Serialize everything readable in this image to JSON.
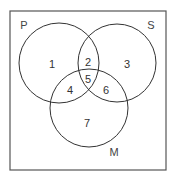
{
  "diagram": {
    "type": "venn",
    "border": {
      "x": 10,
      "y": 11,
      "width": 156,
      "height": 159
    },
    "sets": [
      {
        "name": "P",
        "cx": 59,
        "cy": 63,
        "r": 40,
        "label_x": 24,
        "label_y": 29
      },
      {
        "name": "S",
        "cx": 117,
        "cy": 63,
        "r": 39,
        "label_x": 151,
        "label_y": 29
      },
      {
        "name": "M",
        "cx": 89,
        "cy": 108,
        "r": 39,
        "label_x": 114,
        "label_y": 156
      }
    ],
    "regions": [
      {
        "label": "1",
        "x": 52,
        "y": 64
      },
      {
        "label": "2",
        "x": 88,
        "y": 62
      },
      {
        "label": "3",
        "x": 127,
        "y": 64
      },
      {
        "label": "4",
        "x": 70,
        "y": 90
      },
      {
        "label": "5",
        "x": 88,
        "y": 79
      },
      {
        "label": "6",
        "x": 106,
        "y": 90
      },
      {
        "label": "7",
        "x": 87,
        "y": 123
      }
    ],
    "colors": {
      "stroke": "#333333",
      "background": "#ffffff"
    }
  }
}
